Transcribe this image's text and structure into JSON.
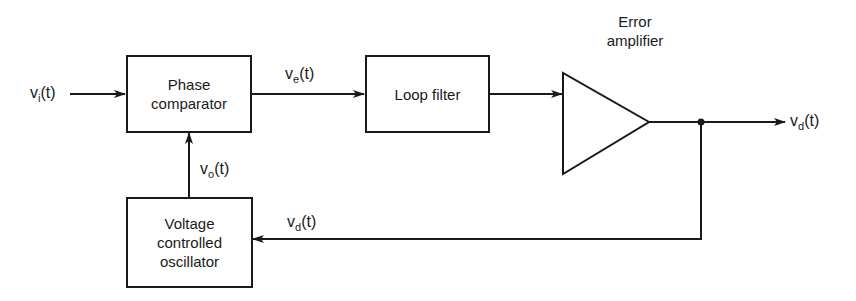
{
  "diagram": {
    "type": "block-diagram",
    "blocks": {
      "phase_comparator": {
        "line1": "Phase",
        "line2": "comparator"
      },
      "loop_filter": {
        "label": "Loop filter"
      },
      "error_amplifier": {
        "line1": "Error",
        "line2": "amplifier"
      },
      "vco": {
        "line1": "Voltage",
        "line2": "controlled",
        "line3": "oscillator"
      }
    },
    "signals": {
      "input": {
        "base": "v",
        "sub": "i",
        "arg": "(t)"
      },
      "error": {
        "base": "v",
        "sub": "e",
        "arg": "(t)"
      },
      "output": {
        "base": "v",
        "sub": "d",
        "arg": "(t)"
      },
      "feedback": {
        "base": "v",
        "sub": "d",
        "arg": "(t)"
      },
      "vco_out": {
        "base": "v",
        "sub": "o",
        "arg": "(t)"
      }
    },
    "colors": {
      "line": "#1a1a1a",
      "background": "#ffffff"
    }
  }
}
